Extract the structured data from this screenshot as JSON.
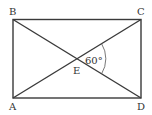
{
  "diagram": {
    "type": "geometry",
    "shape": "rectangle with diagonals",
    "points": {
      "A": {
        "label": "A",
        "x": 12,
        "y": 98
      },
      "B": {
        "label": "B",
        "x": 13,
        "y": 19
      },
      "C": {
        "label": "C",
        "x": 141,
        "y": 20
      },
      "D": {
        "label": "D",
        "x": 141,
        "y": 98
      },
      "E": {
        "label": "E",
        "x": 77,
        "y": 59
      }
    },
    "angle": {
      "label": "60°",
      "vertex": "E",
      "between": [
        "EC",
        "ED"
      ]
    },
    "colors": {
      "stroke": "#3a3a3a",
      "text": "#333333",
      "background": "#ffffff"
    }
  }
}
